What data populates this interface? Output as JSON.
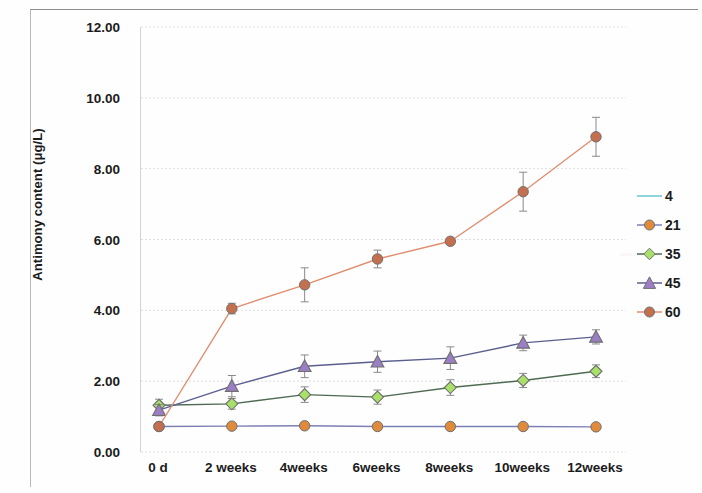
{
  "chart_data": {
    "type": "line",
    "title": "",
    "xlabel": "",
    "ylabel": "Antimony content (μg/L)",
    "categories": [
      "0 d",
      "2 weeks",
      "4weeks",
      "6weeks",
      "8weeks",
      "10weeks",
      "12weeks"
    ],
    "ylim": [
      0,
      12
    ],
    "yticks": [
      "0.00",
      "2.00",
      "4.00",
      "6.00",
      "8.00",
      "10.00",
      "12.00"
    ],
    "ytick_values": [
      0,
      2,
      4,
      6,
      8,
      10,
      12
    ],
    "grid": true,
    "grid_axis": "y",
    "legend_position": "right",
    "series": [
      {
        "name": "4",
        "color": "#68c7d2",
        "marker": "none",
        "values": [
          1.3,
          null,
          null,
          null,
          null,
          null,
          null
        ],
        "errors": [
          0,
          0,
          0,
          0,
          0,
          0,
          0
        ]
      },
      {
        "name": "21",
        "color": "#e08a3c",
        "line_color": "#7b7fb5",
        "marker": "circle",
        "values": [
          0.72,
          0.73,
          0.74,
          0.72,
          0.72,
          0.72,
          0.71
        ],
        "errors": [
          0.06,
          0.05,
          0.06,
          0.05,
          0.05,
          0.05,
          0.05
        ]
      },
      {
        "name": "35",
        "color": "#a8e06a",
        "line_color": "#4f6b52",
        "marker": "diamond",
        "values": [
          1.32,
          1.36,
          1.62,
          1.55,
          1.82,
          2.02,
          2.28
        ],
        "errors": [
          0.17,
          0.15,
          0.22,
          0.2,
          0.22,
          0.2,
          0.18
        ]
      },
      {
        "name": "45",
        "color": "#9b7ec4",
        "line_color": "#5a5f8e",
        "marker": "triangle",
        "values": [
          1.18,
          1.86,
          2.42,
          2.55,
          2.65,
          3.08,
          3.25
        ],
        "errors": [
          0.16,
          0.3,
          0.32,
          0.3,
          0.32,
          0.22,
          0.2
        ]
      },
      {
        "name": "60",
        "color": "#c4704f",
        "line_color": "#e08e72",
        "marker": "circle",
        "values": [
          0.72,
          4.05,
          4.72,
          5.45,
          5.95,
          7.35,
          8.9
        ],
        "errors": [
          0.08,
          0.15,
          0.48,
          0.25,
          0.08,
          0.55,
          0.55
        ]
      }
    ]
  },
  "legend": {
    "items": [
      {
        "label": "4"
      },
      {
        "label": "21"
      },
      {
        "label": "35"
      },
      {
        "label": "45"
      },
      {
        "label": "60"
      }
    ]
  },
  "axes": {
    "y_title": "Antimony content (μg/L)"
  }
}
